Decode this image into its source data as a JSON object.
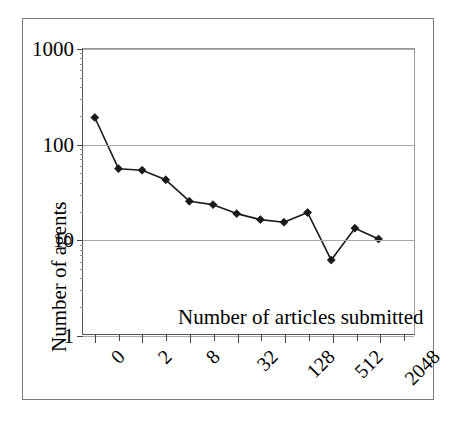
{
  "chart_data": {
    "type": "line",
    "title": "",
    "xlabel": "Number of articles submitted",
    "ylabel": "Number of agents",
    "yscale": "log",
    "ylim": [
      1,
      1000
    ],
    "ytick_labels": [
      "1000",
      "100",
      "10",
      "1"
    ],
    "ytick_values": [
      1000,
      100,
      10,
      1
    ],
    "grid": true,
    "legend": false,
    "x_is_categorical": true,
    "categories": [
      "0",
      "1",
      "2",
      "4",
      "8",
      "16",
      "32",
      "64",
      "128",
      "256",
      "512",
      "1024",
      "2048",
      "4096"
    ],
    "xtick_labels_shown": [
      "0",
      "2",
      "8",
      "32",
      "128",
      "512",
      "2048"
    ],
    "xtick_label_rotation_deg": -45,
    "series": [
      {
        "name": "agents",
        "marker": "diamond",
        "marker_color": "#1a1a1a",
        "line_color": "#1a1a1a",
        "values": [
          190,
          55,
          53,
          42,
          25,
          23,
          18.5,
          16,
          15,
          19,
          6,
          13,
          10,
          null
        ]
      }
    ],
    "points": [
      {
        "x": "0",
        "y": 190
      },
      {
        "x": "1",
        "y": 55
      },
      {
        "x": "2",
        "y": 53
      },
      {
        "x": "4",
        "y": 42
      },
      {
        "x": "8",
        "y": 25
      },
      {
        "x": "16",
        "y": 23
      },
      {
        "x": "32",
        "y": 18.5
      },
      {
        "x": "64",
        "y": 16
      },
      {
        "x": "128",
        "y": 15
      },
      {
        "x": "256",
        "y": 19
      },
      {
        "x": "512",
        "y": 6
      },
      {
        "x": "1024",
        "y": 13
      },
      {
        "x": "2048",
        "y": 10
      }
    ]
  },
  "colors": {
    "plot_line": "#1a1a1a",
    "gridline": "#a9a9a9",
    "axis": "#555555",
    "frame": "#7a7a7a",
    "background": "#ffffff"
  }
}
